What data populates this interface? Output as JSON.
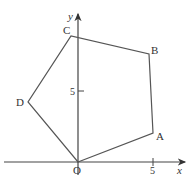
{
  "diagram": {
    "type": "coordinate-geometry",
    "axes": {
      "x_label": "x",
      "y_label": "y",
      "origin_label": "O",
      "x_tick_label": "5",
      "y_tick_label": "5"
    },
    "vertices": [
      {
        "label": "O",
        "px": [
          78,
          162
        ]
      },
      {
        "label": "A",
        "px": [
          153,
          133
        ]
      },
      {
        "label": "B",
        "px": [
          149,
          54
        ]
      },
      {
        "label": "C",
        "px": [
          71,
          36
        ]
      },
      {
        "label": "D",
        "px": [
          28,
          102
        ]
      }
    ],
    "colors": {
      "line": "#555555",
      "text": "#333333"
    }
  }
}
